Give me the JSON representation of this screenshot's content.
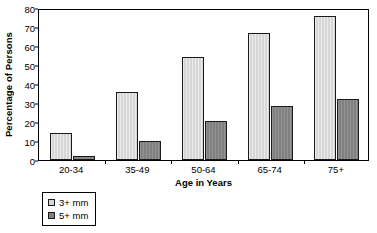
{
  "chart_data": {
    "type": "bar",
    "title": "",
    "xlabel": "Age in Years",
    "ylabel": "Percentage of Persons",
    "categories": [
      "20-34",
      "35-49",
      "50-64",
      "65-74",
      "75+"
    ],
    "series": [
      {
        "name": "3+ mm",
        "values": [
          14,
          36,
          54,
          67,
          76
        ],
        "color": "#d6d6d6"
      },
      {
        "name": "5+ mm",
        "values": [
          2,
          10,
          20.5,
          28.5,
          32
        ],
        "color": "#808080"
      }
    ],
    "ylim": [
      0,
      80
    ],
    "yticks": [
      0,
      10,
      20,
      30,
      40,
      50,
      60,
      70,
      80
    ],
    "ytick_labels": [
      "0",
      "10",
      "20",
      "30",
      "40",
      "50",
      "60",
      "70",
      "80"
    ],
    "grid": false,
    "legend_position": "below-left",
    "legend_entries": [
      "3+ mm",
      "5+ mm"
    ],
    "frame": true
  },
  "axes": {
    "y_title": "Percentage of Persons",
    "x_title": "Age in Years"
  },
  "legend": {
    "items": [
      {
        "label": "3+ mm"
      },
      {
        "label": "5+ mm"
      }
    ]
  },
  "colors": {
    "series_0": "#d6d6d6",
    "series_1": "#808080",
    "axis": "#000000",
    "background": "#ffffff"
  }
}
